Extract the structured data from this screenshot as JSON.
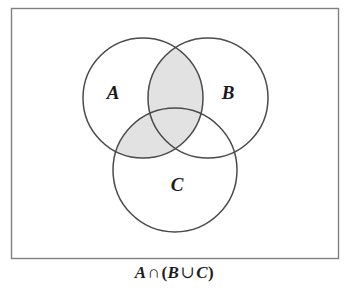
{
  "figure": {
    "type": "venn-diagram",
    "title": "",
    "frame": {
      "x": 11,
      "y": 8,
      "width": 327,
      "height": 250,
      "border_color": "#808080",
      "fill_color": "#ffffff"
    },
    "background_color": "#ffffff",
    "stroke_color": "#4a4a4a",
    "shade_color": "#e2e2e2"
  },
  "sets": [
    {
      "name": "A",
      "label": "A",
      "cx": 143,
      "cy": 98,
      "r": 60,
      "label_x": 113,
      "label_y": 99
    },
    {
      "name": "B",
      "label": "B",
      "cx": 208,
      "cy": 98,
      "r": 60,
      "label_x": 228,
      "label_y": 99
    },
    {
      "name": "C",
      "label": "C",
      "cx": 175,
      "cy": 170,
      "r": 62,
      "label_x": 177,
      "label_y": 191
    }
  ],
  "shaded_regions": [
    {
      "name": "A-intersect-B",
      "description": "lens of A and B"
    },
    {
      "name": "A-intersect-C",
      "description": "lens of A and C"
    }
  ],
  "caption": {
    "full_text": "A ∩ (B ∪ C)",
    "set_a": "A",
    "intersection_symbol": "∩",
    "open_paren": "(",
    "set_b": "B",
    "union_symbol": "∪",
    "set_c": "C",
    "close_paren": ")"
  }
}
